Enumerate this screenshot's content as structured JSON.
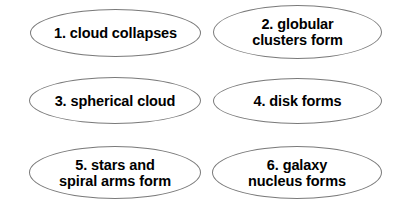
{
  "diagram": {
    "type": "flow-steps",
    "background_color": "#ffffff",
    "node_fill_color": "#ffffff",
    "node_stroke_color": "#7a7a7a",
    "text_color": "#000000",
    "nodes": [
      {
        "id": "1",
        "label": "1. cloud collapses"
      },
      {
        "id": "2",
        "label": "2. globular\nclusters form"
      },
      {
        "id": "3",
        "label": "3. spherical cloud"
      },
      {
        "id": "4",
        "label": "4. disk forms"
      },
      {
        "id": "5",
        "label": "5. stars and\nspiral arms form"
      },
      {
        "id": "6",
        "label": "6. galaxy\nnucleus forms"
      }
    ]
  }
}
